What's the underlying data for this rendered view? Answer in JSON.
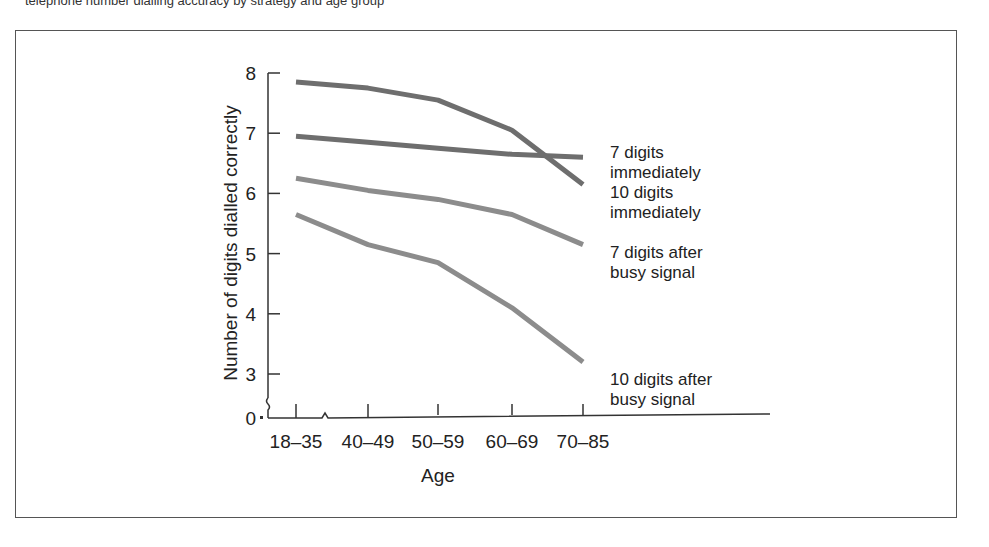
{
  "caption_clipped": "telephone number dialling accuracy by strategy and age group",
  "chart_data": {
    "type": "line",
    "title": "",
    "xlabel": "Age",
    "ylabel": "Number of digits dialled correctly",
    "categories": [
      "18–35",
      "40–49",
      "50–59",
      "60–69",
      "70–85"
    ],
    "yticks": [
      "0",
      "3",
      "4",
      "5",
      "6",
      "7",
      "8"
    ],
    "ylim": [
      0,
      8
    ],
    "axis_break": true,
    "grid": false,
    "legend_position": "right (inline labels)",
    "series": [
      {
        "name": "7 digits immediately",
        "label_lines": [
          "7 digits",
          "immediately"
        ],
        "values": [
          6.95,
          6.85,
          6.75,
          6.65,
          6.6
        ],
        "color": "#6e6e6e"
      },
      {
        "name": "10 digits immediately",
        "label_lines": [
          "10 digits",
          "immediately"
        ],
        "values": [
          7.85,
          7.75,
          7.55,
          7.05,
          6.15
        ],
        "color": "#6e6e6e"
      },
      {
        "name": "7 digits after busy signal",
        "label_lines": [
          "7 digits after",
          "busy signal"
        ],
        "values": [
          6.25,
          6.05,
          5.9,
          5.65,
          5.15
        ],
        "color": "#8c8c8c"
      },
      {
        "name": "10 digits after busy signal",
        "label_lines": [
          "10 digits after",
          "busy signal"
        ],
        "values": [
          5.65,
          5.15,
          4.85,
          4.1,
          3.2
        ],
        "color": "#8c8c8c"
      }
    ]
  }
}
